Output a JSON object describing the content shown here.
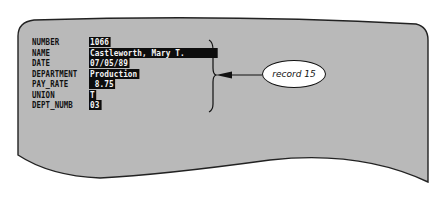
{
  "record": {
    "fields": [
      {
        "label": "NUMBER",
        "value": "1066"
      },
      {
        "label": "NAME",
        "value": "Castleworth, Mary T."
      },
      {
        "label": "DATE",
        "value": "07/05/89"
      },
      {
        "label": "DEPARTMENT",
        "value": "Production"
      },
      {
        "label": "PAY_RATE",
        "value": " 8.75"
      },
      {
        "label": "UNION",
        "value": "T"
      },
      {
        "label": "DEPT_NUMB",
        "value": "03"
      }
    ]
  },
  "callout": {
    "text": "record 15"
  },
  "colors": {
    "screen_fill": "#b9b9b9",
    "outline": "#222222",
    "highlight_bg": "#0d0d0d",
    "highlight_text": "#f4f4f4"
  }
}
